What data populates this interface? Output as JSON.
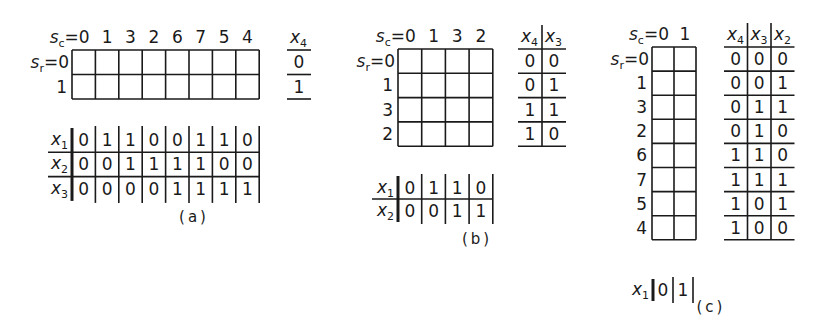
{
  "figure": {
    "panels": [
      {
        "id": "a",
        "caption": "(a)",
        "map": {
          "sc_label": "s",
          "sc_sub": "c",
          "sr_label": "s",
          "sr_sub": "r",
          "col_labels": [
            "0",
            "1",
            "3",
            "2",
            "6",
            "7",
            "5",
            "4"
          ],
          "row_labels": [
            "0",
            "1"
          ]
        },
        "row_var_table": {
          "headers": [
            {
              "var": "x",
              "sub": "4"
            }
          ],
          "rows": [
            [
              "0"
            ],
            [
              "1"
            ]
          ]
        },
        "col_var_table": {
          "vars": [
            {
              "var": "x",
              "sub": "1"
            },
            {
              "var": "x",
              "sub": "2"
            },
            {
              "var": "x",
              "sub": "3"
            }
          ],
          "rows": [
            [
              "0",
              "1",
              "1",
              "0",
              "0",
              "1",
              "1",
              "0"
            ],
            [
              "0",
              "0",
              "1",
              "1",
              "1",
              "1",
              "0",
              "0"
            ],
            [
              "0",
              "0",
              "0",
              "0",
              "1",
              "1",
              "1",
              "1"
            ]
          ]
        }
      },
      {
        "id": "b",
        "caption": "(b)",
        "map": {
          "sc_label": "s",
          "sc_sub": "c",
          "sr_label": "s",
          "sr_sub": "r",
          "col_labels": [
            "0",
            "1",
            "3",
            "2"
          ],
          "row_labels": [
            "0",
            "1",
            "3",
            "2"
          ]
        },
        "row_var_table": {
          "headers": [
            {
              "var": "x",
              "sub": "4"
            },
            {
              "var": "x",
              "sub": "3"
            }
          ],
          "rows": [
            [
              "0",
              "0"
            ],
            [
              "0",
              "1"
            ],
            [
              "1",
              "1"
            ],
            [
              "1",
              "0"
            ]
          ]
        },
        "col_var_table": {
          "vars": [
            {
              "var": "x",
              "sub": "1"
            },
            {
              "var": "x",
              "sub": "2"
            }
          ],
          "rows": [
            [
              "0",
              "1",
              "1",
              "0"
            ],
            [
              "0",
              "0",
              "1",
              "1"
            ]
          ]
        }
      },
      {
        "id": "c",
        "caption": "(c)",
        "map": {
          "sc_label": "s",
          "sc_sub": "c",
          "sr_label": "s",
          "sr_sub": "r",
          "col_labels": [
            "0",
            "1"
          ],
          "row_labels": [
            "0",
            "1",
            "3",
            "2",
            "6",
            "7",
            "5",
            "4"
          ]
        },
        "row_var_table": {
          "headers": [
            {
              "var": "x",
              "sub": "4"
            },
            {
              "var": "x",
              "sub": "3"
            },
            {
              "var": "x",
              "sub": "2"
            }
          ],
          "rows": [
            [
              "0",
              "0",
              "0"
            ],
            [
              "0",
              "0",
              "1"
            ],
            [
              "0",
              "1",
              "1"
            ],
            [
              "0",
              "1",
              "0"
            ],
            [
              "1",
              "1",
              "0"
            ],
            [
              "1",
              "1",
              "1"
            ],
            [
              "1",
              "0",
              "1"
            ],
            [
              "1",
              "0",
              "0"
            ]
          ]
        },
        "col_var_table": {
          "vars": [
            {
              "var": "x",
              "sub": "1"
            }
          ],
          "rows": [
            [
              "0",
              "1"
            ]
          ]
        }
      }
    ]
  }
}
